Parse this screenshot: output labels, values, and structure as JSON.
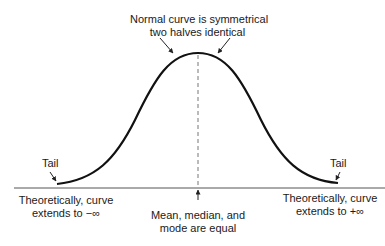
{
  "title_annotation": {
    "line1": "Normal curve is symmetrical",
    "line2": "two halves identical"
  },
  "tail_left": "Tail",
  "tail_right": "Tail",
  "left_extent": {
    "line1": "Theoretically, curve",
    "line2": "extends to −∞"
  },
  "right_extent": {
    "line1": "Theoretically, curve",
    "line2": "extends to +∞"
  },
  "center_annotation": {
    "line1": "Mean, median, and",
    "line2": "mode are equal"
  },
  "colors": {
    "curve": "#111111",
    "baseline": "#555555",
    "dashed": "#777777",
    "text": "#1a1a1a"
  }
}
